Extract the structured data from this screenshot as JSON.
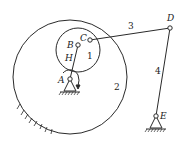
{
  "diagram": {
    "type": "planetary-gear-linkage-mechanism",
    "colors": {
      "line": "#2a2a2a",
      "background": "#ffffff"
    },
    "points": [
      {
        "id": "A",
        "label": "A",
        "x": 70,
        "y": 79,
        "role": "fixed pivot"
      },
      {
        "id": "B",
        "label": "B",
        "x": 78,
        "y": 45,
        "role": "planet gear center"
      },
      {
        "id": "C",
        "label": "C",
        "x": 90,
        "y": 40,
        "role": "joint on gear 1"
      },
      {
        "id": "D",
        "label": "D",
        "x": 170,
        "y": 28,
        "role": "joint"
      },
      {
        "id": "E",
        "label": "E",
        "x": 156,
        "y": 116,
        "role": "fixed pivot"
      }
    ],
    "links": [
      {
        "id": "H",
        "label": "H",
        "from": "A",
        "to": "B",
        "desc": "planet carrier"
      },
      {
        "id": "3",
        "label": "3",
        "from": "C",
        "to": "D",
        "desc": "coupler"
      },
      {
        "id": "4",
        "label": "4",
        "from": "D",
        "to": "E",
        "desc": "rocker"
      }
    ],
    "gears": [
      {
        "id": "1",
        "label": "1",
        "cx": 78,
        "cy": 50,
        "r": 22,
        "desc": "planet gear"
      },
      {
        "id": "2",
        "label": "2",
        "cx": 70,
        "cy": 77,
        "r": 57,
        "desc": "fixed internal ring gear"
      }
    ],
    "annotations": {
      "rotation_arrow_at": "A",
      "ground_hatch": [
        "A",
        "E",
        "ring-gear-2"
      ]
    }
  }
}
